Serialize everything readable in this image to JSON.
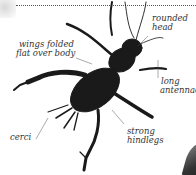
{
  "diagram": {
    "labels": {
      "rounded_head": [
        "rounded",
        "head"
      ],
      "wings": [
        "wings folded",
        "flat over body"
      ],
      "antennae": [
        "long",
        "antennae"
      ],
      "cerci": [
        "cerci"
      ],
      "hindlegs": [
        "strong",
        "hindlegs"
      ]
    },
    "colors": {
      "insect_body": "#1a1a1a",
      "leader_line": "#555555",
      "label_text": "#333333",
      "background": "#ffffff"
    }
  }
}
